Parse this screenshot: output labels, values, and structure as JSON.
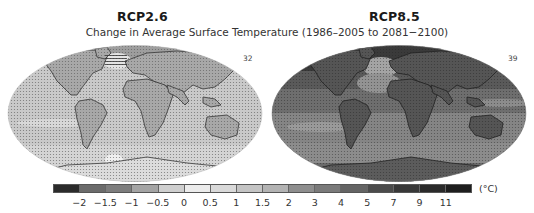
{
  "titles": {
    "left": "RCP2.6",
    "right": "RCP8.5",
    "subtitle": "Change in Average Surface Temperature (1986–2005 to 2081−2100)"
  },
  "panels": [
    {
      "scenario": "RCP2.6",
      "model_count": "32"
    },
    {
      "scenario": "RCP8.5",
      "model_count": "39"
    }
  ],
  "colorbar": {
    "unit": "(°C)",
    "ticks": [
      "−2",
      "−1.5",
      "−1",
      "−0.5",
      "0",
      "0.5",
      "1",
      "1.5",
      "2",
      "3",
      "4",
      "5",
      "7",
      "9",
      "11"
    ],
    "colors": [
      "#2b2b2b",
      "#6b6b6b",
      "#7d7d7d",
      "#a4a4a4",
      "#cfcfcf",
      "#ececec",
      "#d9d9d9",
      "#c4c4c4",
      "#b3b3b3",
      "#8e8e8e",
      "#7a7a7a",
      "#646464",
      "#4b4b4b",
      "#383838",
      "#2a2a2a",
      "#1e1e1e"
    ]
  },
  "maps": {
    "left_ocean": "#c6c6c6",
    "left_land": "#a9a9a9",
    "right_ocean": "#7b7b7b",
    "right_land": "#565656"
  }
}
